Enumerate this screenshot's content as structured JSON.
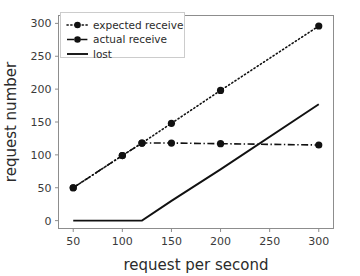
{
  "chart_data": {
    "type": "line",
    "title": "",
    "xlabel": "request per second",
    "ylabel": "request number",
    "x": [
      50,
      100,
      120,
      150,
      200,
      300
    ],
    "xlim": [
      35,
      315
    ],
    "ylim": [
      -12,
      312
    ],
    "xticks": [
      50,
      100,
      150,
      200,
      250,
      300
    ],
    "yticks": [
      0,
      50,
      100,
      150,
      200,
      250,
      300
    ],
    "grid": false,
    "legend_position": "upper left",
    "series": [
      {
        "name": "expected receive",
        "values": [
          50,
          99,
          118,
          148,
          198,
          296
        ],
        "linestyle": "dotted",
        "marker": "circle",
        "color": "#111111"
      },
      {
        "name": "actual receive",
        "values": [
          50,
          99,
          118,
          118,
          117,
          115
        ],
        "linestyle": "dashdot",
        "marker": "circle",
        "color": "#111111"
      },
      {
        "name": "lost",
        "values": [
          0,
          0,
          0,
          30,
          78,
          177
        ],
        "linestyle": "solid",
        "marker": "none",
        "color": "#111111"
      }
    ]
  },
  "axes": {
    "xtick_labels": [
      "50",
      "100",
      "150",
      "200",
      "250",
      "300"
    ],
    "ytick_labels": [
      "0",
      "50",
      "100",
      "150",
      "200",
      "250",
      "300"
    ],
    "xlabel": "request per second",
    "ylabel": "request number"
  },
  "legend": {
    "entries": [
      {
        "label": "expected receive",
        "style": "dotted-circle"
      },
      {
        "label": "actual receive",
        "style": "dashdot-circle"
      },
      {
        "label": "lost",
        "style": "solid"
      }
    ]
  }
}
